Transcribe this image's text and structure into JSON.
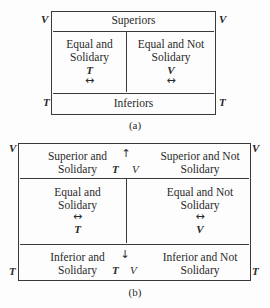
{
  "diagram_a": {
    "caption": "(a)",
    "corner_labels": {
      "top_left": "V",
      "top_right": "V",
      "bottom_left": "T",
      "bottom_right": "T"
    },
    "top_row": "Superiors",
    "middle_left": {
      "line1": "Equal and",
      "line2": "Solidary",
      "symbol": "T",
      "arrow": "↔"
    },
    "middle_right": {
      "line1": "Equal and Not",
      "line2": "Solidary",
      "symbol": "V",
      "arrow": "↔"
    },
    "bottom_row": "Inferiors"
  },
  "diagram_b": {
    "caption": "(b)",
    "corner_labels": {
      "top_left": "V",
      "top_right": "V",
      "bottom_left": "T",
      "bottom_right": "T"
    },
    "top_left": {
      "line1": "Superior and",
      "line2": "Solidary"
    },
    "top_center": {
      "arrow": "↑",
      "symbol_t": "T",
      "symbol_v": "V"
    },
    "top_right": {
      "line1": "Superior and Not",
      "line2": "Solidary"
    },
    "middle_left": {
      "line1": "Equal and",
      "line2": "Solidary",
      "arrow": "↔",
      "symbol": "T"
    },
    "middle_right": {
      "line1": "Equal and Not",
      "line2": "Solidary",
      "arrow": "↔",
      "symbol": "V"
    },
    "bottom_left": {
      "line1": "Inferior and",
      "line2": "Solidary"
    },
    "bottom_center": {
      "arrow": "↓",
      "symbol_t": "T",
      "symbol_v": "V"
    },
    "bottom_right": {
      "line1": "Inferior and Not",
      "line2": "Solidary"
    }
  }
}
